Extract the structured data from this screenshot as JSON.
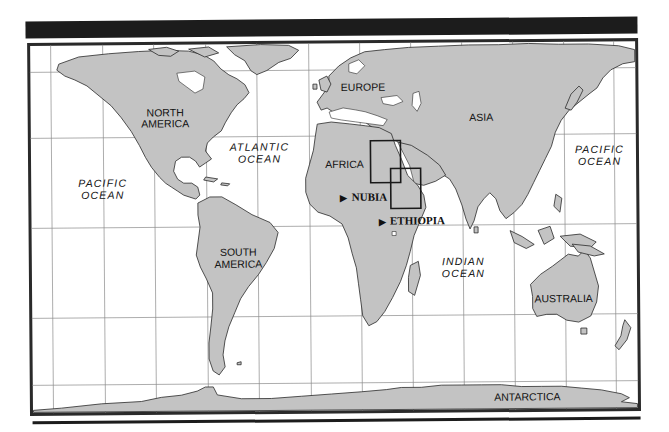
{
  "map": {
    "type": "world-map",
    "land_color": "#c3c3c3",
    "frame_color": "#222222",
    "continents": [
      {
        "id": "north-america",
        "label": [
          "NORTH",
          "AMERICA"
        ]
      },
      {
        "id": "south-america",
        "label": [
          "SOUTH",
          "AMERICA"
        ]
      },
      {
        "id": "europe",
        "label": [
          "EUROPE"
        ]
      },
      {
        "id": "africa",
        "label": [
          "AFRICA"
        ]
      },
      {
        "id": "asia",
        "label": [
          "ASIA"
        ]
      },
      {
        "id": "australia",
        "label": [
          "AUSTRALIA"
        ]
      },
      {
        "id": "antarctica",
        "label": [
          "ANTARCTICA"
        ]
      }
    ],
    "oceans": [
      {
        "id": "pacific-west",
        "label": [
          "PACIFIC",
          "OCEAN"
        ]
      },
      {
        "id": "atlantic",
        "label": [
          "ATLANTIC",
          "OCEAN"
        ]
      },
      {
        "id": "indian",
        "label": [
          "INDIAN",
          "OCEAN"
        ]
      },
      {
        "id": "pacific-east",
        "label": [
          "PACIFIC",
          "OCEAN"
        ]
      }
    ],
    "sites": [
      {
        "id": "nubia",
        "marker": "▶",
        "label": "NUBIA"
      },
      {
        "id": "ethiopia",
        "marker": "▶",
        "label": "ETHIOPIA"
      }
    ]
  }
}
